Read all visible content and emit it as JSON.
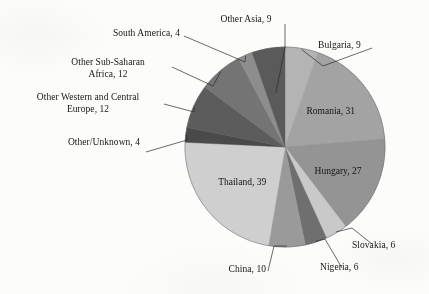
{
  "figure": {
    "background_color": "#fcfcfa",
    "text_color": "#161616"
  },
  "chart_data": {
    "type": "pie",
    "title": "",
    "subtitle": "",
    "xlabel": "",
    "ylabel": "",
    "legend_position": "none",
    "grid": false,
    "total": 169,
    "start_angle_deg": 0,
    "direction": "clockwise",
    "categories": [
      "Bulgaria",
      "Romania",
      "Hungary",
      "Slovakia",
      "Nigeria",
      "China",
      "Thailand",
      "Other/Unknown",
      "Other Western and Central Europe",
      "Other Sub-Saharan Africa",
      "South America",
      "Other Asia"
    ],
    "values": [
      9,
      31,
      27,
      6,
      6,
      10,
      39,
      4,
      12,
      12,
      4,
      9
    ],
    "colors": [
      "#b4b4b4",
      "#a3a3a3",
      "#949494",
      "#c9c9c9",
      "#6f6f6f",
      "#9a9a9a",
      "#cfcfcf",
      "#4a4a4a",
      "#5c5c5c",
      "#747474",
      "#8d8d8d",
      "#5a5a5a"
    ],
    "labels": [
      {
        "key": "bulgaria",
        "text": "Bulgaria, 9",
        "placement": "outside-right"
      },
      {
        "key": "romania",
        "text": "Romania, 31",
        "placement": "inside"
      },
      {
        "key": "hungary",
        "text": "Hungary, 27",
        "placement": "inside"
      },
      {
        "key": "slovakia",
        "text": "Slovakia, 6",
        "placement": "outside-right"
      },
      {
        "key": "nigeria",
        "text": "Nigeria, 6",
        "placement": "outside-bottom"
      },
      {
        "key": "china",
        "text": "China, 10",
        "placement": "outside-bottom"
      },
      {
        "key": "thailand",
        "text": "Thailand, 39",
        "placement": "inside"
      },
      {
        "key": "other-unknown",
        "text": "Other/Unknown, 4",
        "placement": "outside-left"
      },
      {
        "key": "other-wc-europe",
        "text": "Other Western and Central\nEurope, 12",
        "placement": "outside-left"
      },
      {
        "key": "other-ssa",
        "text": "Other Sub-Saharan\nAfrica, 12",
        "placement": "outside-left"
      },
      {
        "key": "south-america",
        "text": "South America, 4",
        "placement": "outside-top"
      },
      {
        "key": "other-asia",
        "text": "Other Asia, 9",
        "placement": "outside-top"
      }
    ]
  }
}
